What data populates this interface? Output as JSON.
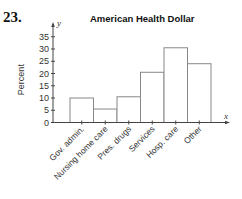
{
  "problem_number": "23.",
  "chart_data": {
    "type": "bar",
    "title": "American Health Dollar",
    "xlabel": "",
    "ylabel": "Percent",
    "x_axis_var": "x",
    "y_axis_var": "y",
    "categories": [
      "Gov. admin.",
      "Nursing home care",
      "Pres. drugs",
      "Services",
      "Hosp. care",
      "Other"
    ],
    "values": [
      10,
      5.5,
      10.5,
      20.5,
      30.5,
      24
    ],
    "yticks": [
      0,
      5,
      10,
      15,
      20,
      25,
      30,
      35
    ],
    "ylim": [
      0,
      37
    ],
    "grid": false,
    "legend": null,
    "bar_fill": "#ffffff",
    "bar_stroke": "#888888"
  }
}
